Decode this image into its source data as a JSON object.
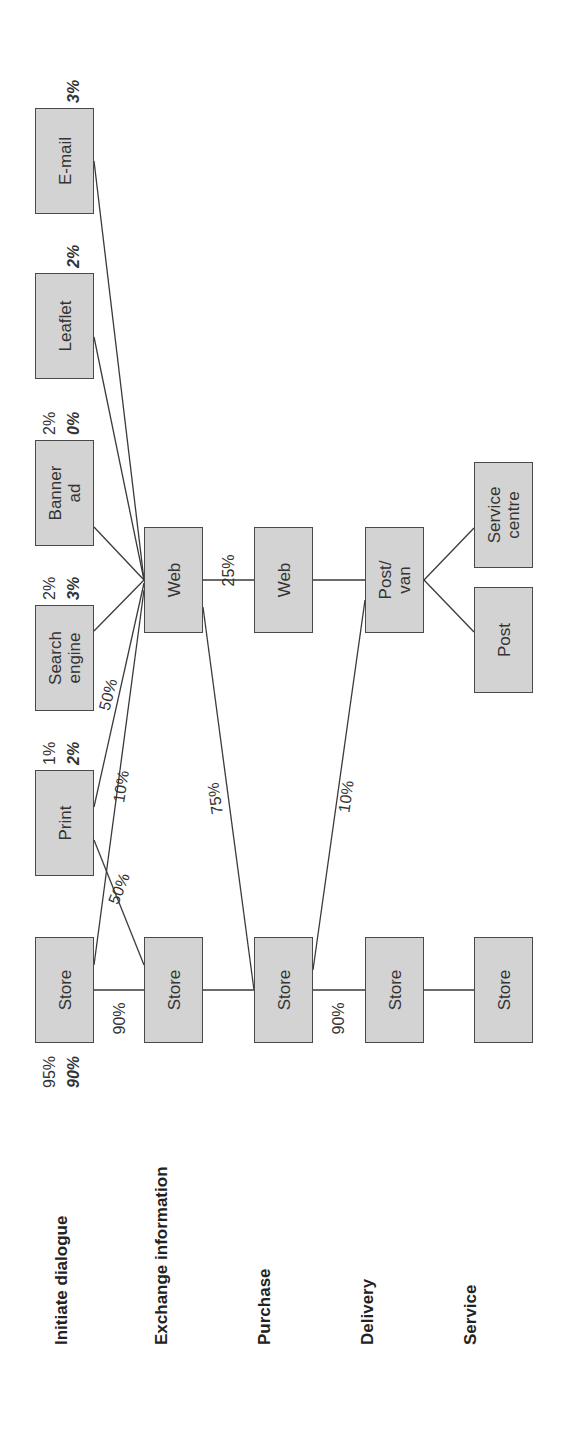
{
  "stages": [
    {
      "label": "Initiate dialogue"
    },
    {
      "label": "Exchange information"
    },
    {
      "label": "Purchase"
    },
    {
      "label": "Delivery"
    },
    {
      "label": "Service"
    }
  ],
  "nodes": {
    "initiate_store": {
      "label": "Store",
      "pct_top": "95%",
      "pct_bottom": "90%"
    },
    "initiate_print": {
      "label": "Print",
      "pct_top": "1%",
      "pct_bottom": "2%"
    },
    "initiate_search_engine": {
      "label": "Search\nengine",
      "pct_top": "2%",
      "pct_bottom": "3%"
    },
    "initiate_banner_ad": {
      "label": "Banner\nad",
      "pct_top": "2%",
      "pct_bottom": "0%"
    },
    "initiate_leaflet": {
      "label": "Leaflet",
      "pct_bottom": "2%"
    },
    "initiate_email": {
      "label": "E-mail",
      "pct_bottom": "3%"
    },
    "exchange_store": {
      "label": "Store"
    },
    "exchange_web": {
      "label": "Web"
    },
    "purchase_store": {
      "label": "Store"
    },
    "purchase_web": {
      "label": "Web"
    },
    "delivery_store": {
      "label": "Store"
    },
    "delivery_post_van": {
      "label": "Post/\nvan"
    },
    "service_store": {
      "label": "Store"
    },
    "service_post": {
      "label": "Post"
    },
    "service_centre": {
      "label": "Service\ncentre"
    }
  },
  "edges": [
    {
      "from": "initiate_store",
      "to": "exchange_store",
      "label": "90%"
    },
    {
      "from": "initiate_store",
      "to": "exchange_web",
      "label": "10%"
    },
    {
      "from": "initiate_print",
      "to": "exchange_store",
      "label": "50%"
    },
    {
      "from": "initiate_print",
      "to": "exchange_web",
      "label": "50%"
    },
    {
      "from": "initiate_search_engine",
      "to": "exchange_web",
      "label": ""
    },
    {
      "from": "initiate_banner_ad",
      "to": "exchange_web",
      "label": ""
    },
    {
      "from": "initiate_leaflet",
      "to": "exchange_web",
      "label": ""
    },
    {
      "from": "initiate_email",
      "to": "exchange_web",
      "label": ""
    },
    {
      "from": "exchange_store",
      "to": "purchase_store",
      "label": ""
    },
    {
      "from": "exchange_web",
      "to": "purchase_web",
      "label": "25%"
    },
    {
      "from": "exchange_web",
      "to": "purchase_store",
      "label": "75%"
    },
    {
      "from": "purchase_store",
      "to": "delivery_store",
      "label": "90%"
    },
    {
      "from": "purchase_store",
      "to": "delivery_post_van",
      "label": "10%"
    },
    {
      "from": "purchase_web",
      "to": "delivery_post_van",
      "label": ""
    },
    {
      "from": "delivery_store",
      "to": "service_store",
      "label": ""
    },
    {
      "from": "delivery_post_van",
      "to": "service_post",
      "label": ""
    },
    {
      "from": "delivery_post_van",
      "to": "service_centre",
      "label": ""
    }
  ],
  "colors": {
    "box_fill": "#d3d3d3",
    "box_border": "#4a4a4a",
    "line": "#333333",
    "text": "#222222"
  }
}
